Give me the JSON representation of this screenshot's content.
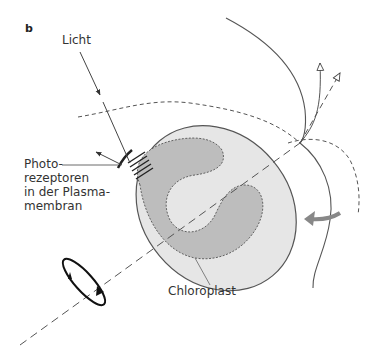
{
  "figure": {
    "panel_label": "b",
    "labels": {
      "light": "Licht",
      "photoreceptors": [
        "Photo-",
        "rezeptoren",
        "in der Plasma-",
        "membran"
      ],
      "chloroplast": "Chloroplast"
    },
    "colors": {
      "cell_fill": "#e6e6e6",
      "chloroplast_fill": "#bdbdbd",
      "line": "#444444",
      "rotation_arrow": "#888888"
    }
  }
}
